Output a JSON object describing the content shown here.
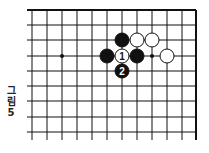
{
  "figure": {
    "caption_lines": [
      "그",
      "림",
      "5"
    ],
    "caption": "그림 5"
  },
  "board": {
    "line_color": "#111111",
    "stone_black": "#111111",
    "stone_white": "#ffffff",
    "cols_x": [
      32,
      47,
      62,
      77,
      92,
      107,
      122,
      137,
      152,
      167,
      182,
      196
    ],
    "rows_y": [
      10,
      25,
      40,
      56,
      71,
      86,
      101,
      117,
      132
    ],
    "top_edge": true,
    "right_edge": true,
    "hoshi": [
      {
        "col": 2,
        "row": 3
      },
      {
        "col": 8,
        "row": 3
      }
    ],
    "stones": [
      {
        "color": "black",
        "col": 6,
        "row": 2,
        "label": ""
      },
      {
        "color": "white",
        "col": 7,
        "row": 2,
        "label": ""
      },
      {
        "color": "white",
        "col": 8,
        "row": 2,
        "label": ""
      },
      {
        "color": "black",
        "col": 5,
        "row": 3,
        "label": ""
      },
      {
        "color": "white",
        "col": 6,
        "row": 3,
        "label": "1"
      },
      {
        "color": "black",
        "col": 7,
        "row": 3,
        "label": ""
      },
      {
        "color": "white",
        "col": 9,
        "row": 3,
        "label": ""
      },
      {
        "color": "black",
        "col": 6,
        "row": 4,
        "label": "2"
      }
    ]
  }
}
